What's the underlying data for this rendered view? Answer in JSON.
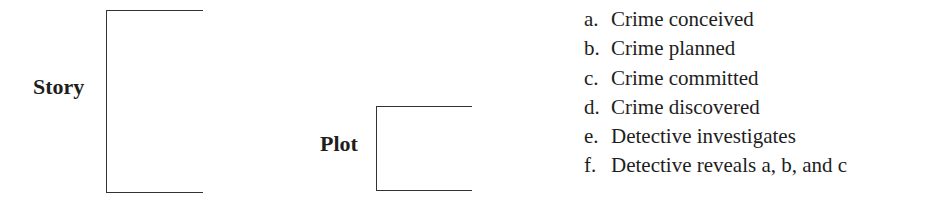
{
  "story": {
    "label": "Story"
  },
  "plot": {
    "label": "Plot"
  },
  "events": [
    {
      "letter": "a.",
      "text": "Crime conceived"
    },
    {
      "letter": "b.",
      "text": "Crime planned"
    },
    {
      "letter": "c.",
      "text": "Crime committed"
    },
    {
      "letter": "d.",
      "text": "Crime discovered"
    },
    {
      "letter": "e.",
      "text": "Detective investigates"
    },
    {
      "letter": "f.",
      "text": "Detective reveals a, b, and c"
    }
  ]
}
